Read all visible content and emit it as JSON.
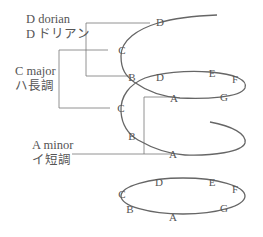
{
  "labels": {
    "dorian": {
      "en": "D dorian",
      "ja": "D ドリアン"
    },
    "major": {
      "en": "C major",
      "ja": "ハ長調"
    },
    "minor": {
      "en": "A minor",
      "ja": "イ短調"
    }
  },
  "spiral_notes": {
    "top": [
      "D",
      "C",
      "B",
      "A",
      "G"
    ],
    "middle": [
      "D",
      "E",
      "F",
      "C",
      "B",
      "A"
    ],
    "bottom_loop": [
      "D",
      "E",
      "F",
      "G",
      "A",
      "B",
      "C"
    ]
  },
  "notes": {
    "d1": "D",
    "c1": "C",
    "b1": "B",
    "d2": "D",
    "e1": "E",
    "f1": "F",
    "a1": "A",
    "g1": "G",
    "c2": "C",
    "b2": "B",
    "a2": "A",
    "d3": "D",
    "e3": "E",
    "f3": "F",
    "g3": "G",
    "a3": "A",
    "b3": "B",
    "c3": "C"
  },
  "colors": {
    "line": "#666666",
    "text": "#555555"
  }
}
